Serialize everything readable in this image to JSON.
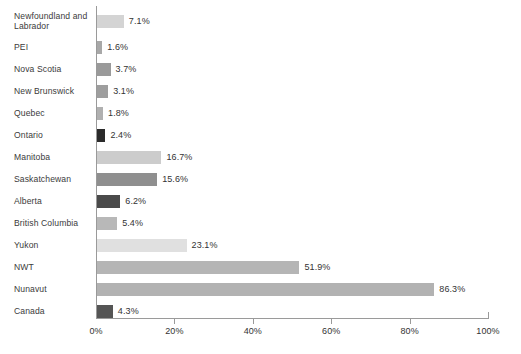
{
  "chart_data": {
    "type": "bar",
    "orientation": "horizontal",
    "title": "",
    "xlabel": "",
    "ylabel": "",
    "xlim": [
      0,
      100
    ],
    "grid": false,
    "legend": "none",
    "value_suffix": "%",
    "xticks": [
      "0%",
      "20%",
      "40%",
      "60%",
      "80%",
      "100%"
    ],
    "xtick_values": [
      0,
      20,
      40,
      60,
      80,
      100
    ],
    "categories": [
      "Newfoundland and Labrador",
      "PEI",
      "Nova Scotia",
      "New Brunswick",
      "Quebec",
      "Ontario",
      "Manitoba",
      "Saskatchewan",
      "Alberta",
      "British Columbia",
      "Yukon",
      "NWT",
      "Nunavut",
      "Canada"
    ],
    "values": [
      7.1,
      1.6,
      3.7,
      3.1,
      1.8,
      2.4,
      16.7,
      15.6,
      6.2,
      5.4,
      23.1,
      51.9,
      86.3,
      4.3
    ],
    "value_labels": [
      "7.1%",
      "1.6%",
      "3.7%",
      "3.1%",
      "1.8%",
      "2.4%",
      "16.7%",
      "15.6%",
      "6.2%",
      "5.4%",
      "23.1%",
      "51.9%",
      "86.3%",
      "4.3%"
    ],
    "bar_colors": [
      "#d4d4d4",
      "#a8a8a8",
      "#9a9a9a",
      "#9e9e9e",
      "#b0b0b0",
      "#2b2b2b",
      "#cccccc",
      "#8f8f8f",
      "#4a4a4a",
      "#b8b8b8",
      "#e0e0e0",
      "#b5b5b5",
      "#b2b2b2",
      "#555555"
    ]
  },
  "caption": ""
}
